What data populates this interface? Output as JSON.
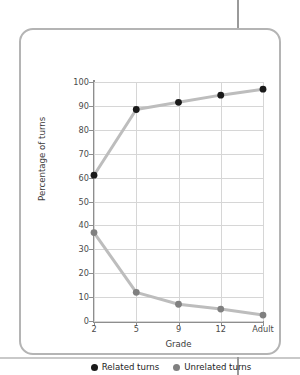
{
  "source_credit": "SCIENCE 306: 179–182",
  "legend": {
    "items": [
      {
        "label": "Related turns",
        "color": "#1a1a1a",
        "marker": "filled-circle-icon"
      },
      {
        "label": "Unrelated turns",
        "color": "#808080",
        "marker": "filled-circle-icon"
      }
    ]
  },
  "chart_data": {
    "type": "line",
    "title": "",
    "xlabel": "Grade",
    "ylabel": "Percentage of turns",
    "categories": [
      "2",
      "5",
      "9",
      "12",
      "Adult"
    ],
    "ylim": [
      0,
      100
    ],
    "yticks": [
      0,
      10,
      20,
      30,
      40,
      50,
      60,
      70,
      80,
      90,
      100
    ],
    "ytick_labels": [
      "0",
      "10",
      "20",
      "30",
      "40",
      "50",
      "60",
      "70",
      "80",
      "90",
      "100"
    ],
    "grid": true,
    "legend_position": "bottom",
    "line_color": "#bdbdbd",
    "series": [
      {
        "name": "Related turns",
        "color": "#1a1a1a",
        "values": [
          61,
          88.5,
          91.5,
          94.5,
          97
        ]
      },
      {
        "name": "Unrelated turns",
        "color": "#808080",
        "values": [
          37,
          12,
          7,
          5,
          2.5
        ]
      }
    ]
  }
}
